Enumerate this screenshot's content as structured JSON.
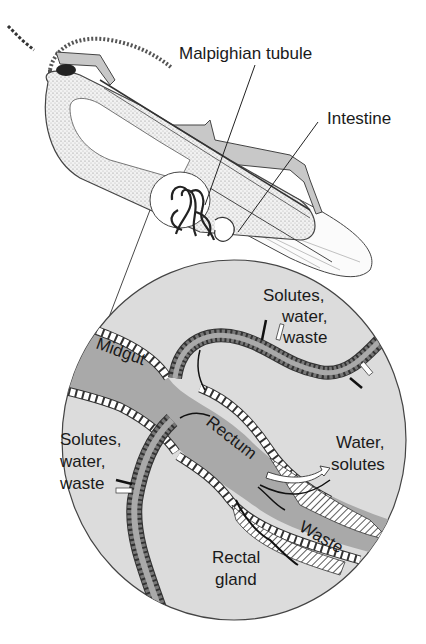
{
  "figure": {
    "type": "anatomical diagram",
    "colors": {
      "background": "#ffffff",
      "circle_fill": "#dcdcdc",
      "gut_fill": "#a9a9a9",
      "tubule_fill": "#9a9a9a",
      "outline": "#333333",
      "body_stipple": "#e8e8e8"
    }
  },
  "labels": {
    "malpighian_tubule": "Malpighian tubule",
    "intestine": "Intestine",
    "midgut": "Midgut",
    "rectum": "Rectum",
    "waste": "Waste",
    "rectal_gland_line1": "Rectal",
    "rectal_gland_line2": "gland",
    "solutes_top_line1": "Solutes,",
    "solutes_top_line2": "water,",
    "solutes_top_line3": "waste",
    "solutes_left_line1": "Solutes,",
    "solutes_left_line2": "water,",
    "solutes_left_line3": "waste",
    "water_solutes_line1": "Water,",
    "water_solutes_line2": "solutes"
  }
}
